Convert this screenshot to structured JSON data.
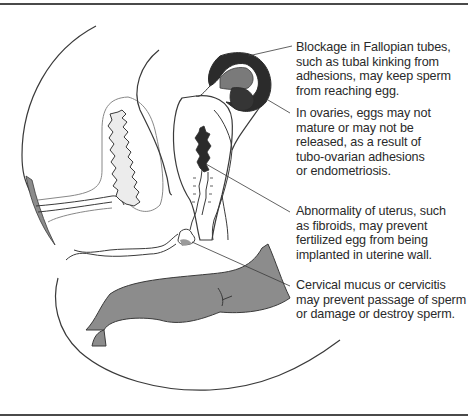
{
  "figure": {
    "colors": {
      "line": "#333333",
      "gray_fill": "#8c8c8c",
      "dark_fill": "#2b2b2b",
      "mid_fill": "#7a7a7a",
      "stipple": "#e6e6e6",
      "text": "#2a2a2a"
    }
  },
  "callouts": [
    {
      "id": "fallopian",
      "lines": [
        "Blockage in Fallopian tubes,",
        "such as tubal kinking from",
        "adhesions, may keep sperm",
        "from reaching egg."
      ]
    },
    {
      "id": "ovaries",
      "lines": [
        "In ovaries, eggs may not",
        "mature or may not be",
        "released, as a result of",
        "tubo-ovarian adhesions",
        "or endometriosis."
      ]
    },
    {
      "id": "uterus",
      "lines": [
        "Abnormality of uterus, such",
        "as fibroids, may prevent",
        "fertilized egg from being",
        "implanted in uterine wall."
      ]
    },
    {
      "id": "cervix",
      "lines": [
        "Cervical mucus or cervicitis",
        "may prevent passage of sperm",
        "or damage or destroy sperm."
      ]
    }
  ]
}
